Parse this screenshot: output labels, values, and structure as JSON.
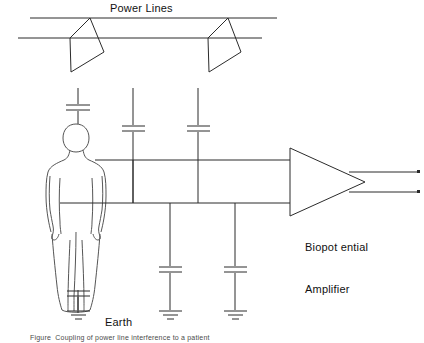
{
  "figure": {
    "caption": "Figure  Coupling of power line interference to a patient",
    "stroke_color": "#2b2b2b",
    "text_color": "#111111",
    "background": "#ffffff",
    "width": 424,
    "height": 343
  },
  "labels": {
    "power_lines": "Power Lines",
    "earth": "Earth",
    "amplifier_line1": "Biopot ential",
    "amplifier_line2": "Amplifier"
  },
  "components": {
    "power_line_upper": {
      "name": "power-line-upper",
      "y": 18,
      "x1": 30,
      "x2": 277
    },
    "power_line_lower": {
      "name": "power-line-lower",
      "y": 38,
      "x1": 18,
      "x2": 262
    },
    "lamps": [
      {
        "name": "lamp-fixture-left",
        "hang_x": 90,
        "hang_y": 18
      },
      {
        "name": "lamp-fixture-right",
        "hang_x": 228,
        "hang_y": 18
      }
    ],
    "stray_capacitors": [
      {
        "name": "capacitor-head",
        "x": 78,
        "y": 108,
        "label": ""
      },
      {
        "name": "capacitor-mid-left",
        "x": 133,
        "y": 128,
        "label": ""
      },
      {
        "name": "capacitor-mid-right",
        "x": 198,
        "y": 128,
        "label": ""
      },
      {
        "name": "capacitor-body-earth",
        "x": 78,
        "y": 294,
        "label": ""
      },
      {
        "name": "capacitor-lead-left",
        "x": 170,
        "y": 270,
        "label": ""
      },
      {
        "name": "capacitor-lead-right",
        "x": 235,
        "y": 270,
        "label": ""
      }
    ],
    "grounds": [
      {
        "name": "ground-body",
        "x": 78,
        "y": 312
      },
      {
        "name": "ground-lead-left",
        "x": 170,
        "y": 312
      },
      {
        "name": "ground-lead-right",
        "x": 235,
        "y": 312
      }
    ],
    "electrode_leads": [
      {
        "name": "electrode-lead-upper",
        "y": 160,
        "x1": 95,
        "x2": 290
      },
      {
        "name": "electrode-lead-lower",
        "y": 203,
        "x1": 60,
        "x2": 290
      }
    ],
    "amplifier": {
      "name": "biopotential-amplifier",
      "apex_x": 365,
      "top_y": 148,
      "bottom_y": 216,
      "left_x": 290
    },
    "outputs": [
      {
        "name": "amplifier-output-upper",
        "y": 172,
        "x1": 365,
        "x2": 420
      },
      {
        "name": "amplifier-output-lower",
        "y": 192,
        "x1": 365,
        "x2": 420
      }
    ],
    "subject": {
      "name": "human-body-outline",
      "description": "standing person, rear view outline"
    }
  }
}
